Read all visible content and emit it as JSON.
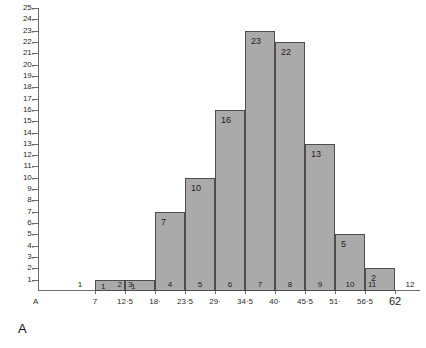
{
  "figure": {
    "caption": "A",
    "axis_origin_label": "A"
  },
  "axes": {
    "y_tick_labels": [
      "25.",
      "24.",
      "23.",
      "22.",
      "21.",
      "20.",
      "19.",
      "18.",
      "17.",
      "16.",
      "15.",
      "14.",
      "13.",
      "12.",
      "11.",
      "10.",
      "9.",
      "8.",
      "7.",
      "6.",
      "5.",
      "4.",
      "3.",
      "2.",
      "1."
    ],
    "x_tick_labels": [
      "7",
      "12·5",
      "18·",
      "23·5",
      "29·",
      "34·5",
      "40·",
      "45·5",
      "51·",
      "56·5",
      "62"
    ]
  },
  "chart_data": {
    "type": "bar",
    "title": "",
    "xlabel": "",
    "ylabel": "",
    "ylim": [
      0,
      25
    ],
    "grid": false,
    "legend": "none",
    "bar_color": "#aaaaaa",
    "bar_edge_color": "#4d4d4d",
    "categories": [
      "1",
      "2",
      "3",
      "4",
      "5",
      "6",
      "7",
      "8",
      "9",
      "10",
      "11",
      "12"
    ],
    "values": [
      0,
      1,
      1,
      7,
      10,
      16,
      23,
      22,
      13,
      5,
      2,
      0
    ],
    "bin_edges": [
      "7",
      "12·5",
      "18·",
      "23·5",
      "29·",
      "34·5",
      "40·",
      "45·5",
      "51·",
      "56·5",
      "62"
    ],
    "bar_value_labels": [
      "",
      "1",
      "1",
      "7",
      "10",
      "16",
      "23",
      "22",
      "13",
      "5",
      "2",
      ""
    ],
    "bin_number_labels": [
      "1",
      "2",
      "3",
      "4",
      "5",
      "6",
      "7",
      "8",
      "9",
      "10",
      "11",
      "12"
    ]
  }
}
